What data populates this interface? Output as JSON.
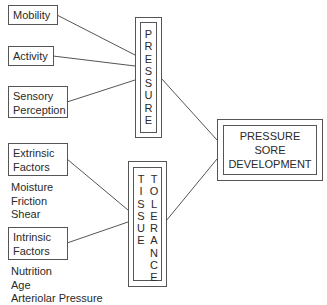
{
  "diagram": {
    "pressure_factors": [
      {
        "lines": [
          "Mobility"
        ]
      },
      {
        "lines": [
          "Activity"
        ]
      },
      {
        "lines": [
          "Sensory",
          "Perception"
        ]
      }
    ],
    "pressure_label": "PRESSURE",
    "tissue_label_left": "TISSUE",
    "tissue_label_right": "TOLERANCE",
    "extrinsic": {
      "lines": [
        "Extrinsic",
        "Factors"
      ],
      "items": [
        "Moisture",
        "Friction",
        "Shear"
      ]
    },
    "intrinsic": {
      "lines": [
        "Intrinsic",
        "Factors"
      ],
      "items": [
        "Nutrition",
        "Age",
        "Arteriolar Pressure"
      ]
    },
    "outcome": {
      "lines": [
        "PRESSURE",
        "SORE",
        "DEVELOPMENT"
      ]
    }
  }
}
